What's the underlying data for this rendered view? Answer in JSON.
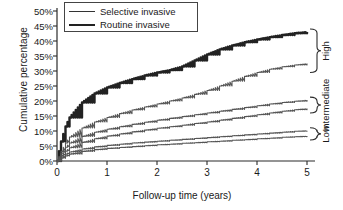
{
  "chart_data": {
    "type": "line",
    "title": "",
    "xlabel": "Follow-up time (years)",
    "ylabel": "Cumulative percentage",
    "xlim": [
      0,
      5
    ],
    "ylim": [
      0,
      50
    ],
    "xticks": [
      "0",
      "1",
      "2",
      "3",
      "4",
      "5"
    ],
    "yticks": [
      "0%",
      "5%",
      "10%",
      "15%",
      "20%",
      "25%",
      "30%",
      "35%",
      "40%",
      "45%",
      "50%"
    ],
    "grid": false,
    "legend_position": "top-center",
    "legend": [
      "Selective invasive",
      "Routine invasive"
    ],
    "annotations": [
      "High",
      "Intermediate",
      "Low"
    ],
    "x": [
      0,
      0.08,
      0.17,
      0.25,
      0.5,
      0.75,
      1,
      1.25,
      1.5,
      1.75,
      2,
      2.25,
      2.5,
      2.75,
      3,
      3.25,
      3.5,
      3.75,
      4,
      4.25,
      4.5,
      4.75,
      5
    ],
    "series": [
      {
        "name": "Routine invasive - High",
        "risk_group": "High",
        "arm": "Routine invasive",
        "style": "thick",
        "values": [
          0,
          6.5,
          11.5,
          14.5,
          19.5,
          22.5,
          24.5,
          26.0,
          27.3,
          28.5,
          29.5,
          30.3,
          31.5,
          33.5,
          35.5,
          37.2,
          38.5,
          39.6,
          40.5,
          41.3,
          42.0,
          42.6,
          43.0
        ]
      },
      {
        "name": "Selective invasive - High",
        "risk_group": "High",
        "arm": "Selective invasive",
        "style": "thin",
        "values": [
          0,
          3.2,
          6.0,
          8.0,
          11.0,
          13.0,
          14.5,
          15.8,
          17.0,
          18.0,
          19.0,
          20.0,
          21.0,
          22.2,
          23.5,
          25.0,
          26.6,
          28.2,
          29.5,
          30.6,
          31.4,
          32.0,
          32.5
        ]
      },
      {
        "name": "Routine invasive - Intermediate",
        "risk_group": "Intermediate",
        "arm": "Routine invasive",
        "style": "thin",
        "values": [
          0,
          2.6,
          4.6,
          6.0,
          8.2,
          9.6,
          10.6,
          11.4,
          12.2,
          12.9,
          13.6,
          14.2,
          14.8,
          15.4,
          16.0,
          16.6,
          17.2,
          17.8,
          18.4,
          19.0,
          19.5,
          19.9,
          20.3
        ]
      },
      {
        "name": "Selective invasive - Intermediate",
        "risk_group": "Intermediate",
        "arm": "Selective invasive",
        "style": "thin",
        "values": [
          0,
          1.8,
          3.3,
          4.4,
          6.2,
          7.4,
          8.3,
          9.0,
          9.7,
          10.3,
          10.9,
          11.4,
          11.9,
          12.5,
          13.0,
          13.6,
          14.2,
          14.8,
          15.4,
          16.0,
          16.6,
          17.1,
          17.5
        ]
      },
      {
        "name": "Routine invasive - Low",
        "risk_group": "Low",
        "arm": "Routine invasive",
        "style": "thin",
        "values": [
          0,
          1.3,
          2.3,
          3.0,
          4.0,
          4.7,
          5.2,
          5.6,
          6.0,
          6.3,
          6.6,
          6.9,
          7.2,
          7.5,
          7.8,
          8.1,
          8.4,
          8.7,
          9.0,
          9.3,
          9.6,
          9.9,
          10.1
        ]
      },
      {
        "name": "Selective invasive - Low",
        "risk_group": "Low",
        "arm": "Selective invasive",
        "style": "thin",
        "values": [
          0,
          0.9,
          1.7,
          2.3,
          3.2,
          3.8,
          4.2,
          4.5,
          4.8,
          5.1,
          5.4,
          5.6,
          5.9,
          6.1,
          6.4,
          6.6,
          6.9,
          7.1,
          7.4,
          7.6,
          7.9,
          8.1,
          8.3
        ]
      }
    ]
  },
  "axes": {
    "ylabel": "Cumulative percentage",
    "xlabel": "Follow-up time (years)"
  },
  "legend": {
    "items": [
      {
        "label": "Selective invasive",
        "style": "thin"
      },
      {
        "label": "Routine invasive",
        "style": "thick"
      }
    ]
  },
  "groups": [
    {
      "label": "High"
    },
    {
      "label": "Intermediate"
    },
    {
      "label": "Low"
    }
  ],
  "colors": {
    "axis": "#2b2b2b",
    "thick_line": "#222222",
    "thin_line": "#555555",
    "background": "#ffffff"
  }
}
